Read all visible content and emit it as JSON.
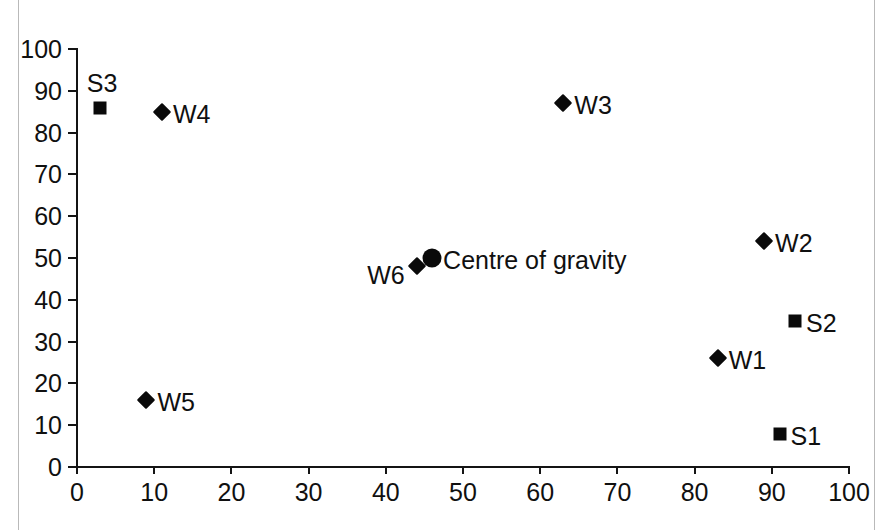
{
  "chart_data": {
    "type": "scatter",
    "title": "",
    "subtitle": "",
    "xlabel": "",
    "ylabel": "",
    "xlim": [
      0,
      100
    ],
    "ylim": [
      0,
      100
    ],
    "xticks": [
      0,
      10,
      20,
      30,
      40,
      50,
      60,
      70,
      80,
      90,
      100
    ],
    "yticks": [
      0,
      10,
      20,
      30,
      40,
      50,
      60,
      70,
      80,
      90,
      100
    ],
    "xtick_labels": [
      "0",
      "10",
      "20",
      "30",
      "40",
      "50",
      "60",
      "70",
      "80",
      "90",
      "100"
    ],
    "ytick_labels": [
      "0",
      "10",
      "20",
      "30",
      "40",
      "50",
      "60",
      "70",
      "80",
      "90",
      "100"
    ],
    "grid": false,
    "legend": false,
    "legend_position": "none",
    "marker_color": "#0a0a0a",
    "axis_color": "#141414",
    "background": "#ffffff",
    "series": [
      {
        "name": "Warehouses",
        "marker": "diamond",
        "points": [
          {
            "label": "W1",
            "x": 83,
            "y": 26,
            "label_pos": "right"
          },
          {
            "label": "W2",
            "x": 89,
            "y": 54,
            "label_pos": "right"
          },
          {
            "label": "W3",
            "x": 63,
            "y": 87,
            "label_pos": "right"
          },
          {
            "label": "W4",
            "x": 11,
            "y": 85,
            "label_pos": "right"
          },
          {
            "label": "W5",
            "x": 9,
            "y": 16,
            "label_pos": "right"
          },
          {
            "label": "W6",
            "x": 44,
            "y": 48,
            "label_pos": "left"
          }
        ]
      },
      {
        "name": "Suppliers",
        "marker": "square",
        "points": [
          {
            "label": "S1",
            "x": 91,
            "y": 8,
            "label_pos": "right"
          },
          {
            "label": "S2",
            "x": 93,
            "y": 35,
            "label_pos": "right"
          },
          {
            "label": "S3",
            "x": 3,
            "y": 86,
            "label_pos": "above"
          }
        ]
      },
      {
        "name": "Centre of gravity",
        "marker": "circle",
        "points": [
          {
            "label": "Centre of gravity",
            "x": 46,
            "y": 50,
            "label_pos": "right"
          }
        ]
      }
    ]
  }
}
